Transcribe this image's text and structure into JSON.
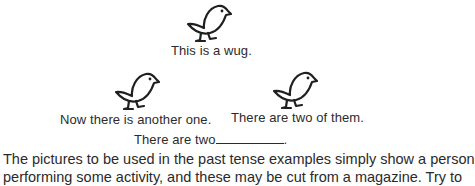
{
  "figure": {
    "wug_1": {
      "icon": "bird-icon",
      "caption": "This is a wug."
    },
    "wug_2": {
      "icon": "bird-icon",
      "caption": "Now there is another one."
    },
    "wug_3": {
      "icon": "bird-icon",
      "caption": "There are two of them."
    },
    "prompt": {
      "text": "There are two",
      "end": "."
    }
  },
  "body_text": {
    "line_1": "The pictures to be used in the past tense examples simply show a person",
    "line_2": "performing some activity, and these may be cut from a magazine. Try to"
  }
}
